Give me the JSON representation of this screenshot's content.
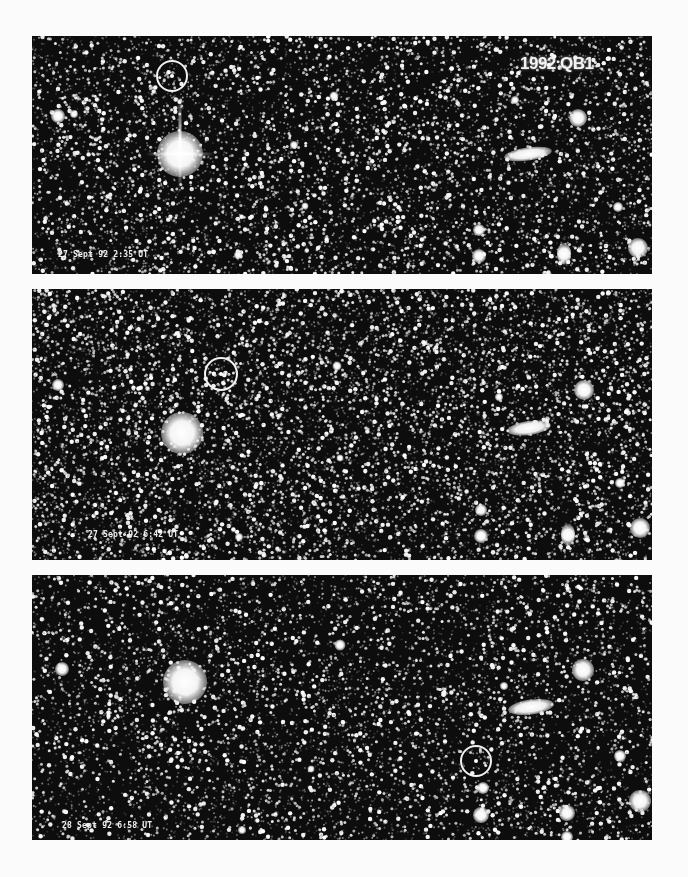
{
  "figure": {
    "object_name": "1992 QB1",
    "background_color": "#fbfbfb",
    "sky_color": "#0d0d0d",
    "panels": [
      {
        "id": "panel-1",
        "timestamp": "27 Sept 92 2:35 UT",
        "top": 36,
        "height": 238,
        "marker": {
          "x": 140,
          "y": 40,
          "d": 32
        },
        "bright_star": {
          "x": 148,
          "y": 118,
          "d": 46,
          "spikes": true
        },
        "galaxy": {
          "x": 496,
          "y": 118,
          "w": 48,
          "h": 13
        },
        "objects": [
          {
            "x": 26,
            "y": 80,
            "d": 14
          },
          {
            "x": 42,
            "y": 78,
            "d": 8
          },
          {
            "x": 302,
            "y": 60,
            "d": 9
          },
          {
            "x": 262,
            "y": 109,
            "d": 8
          },
          {
            "x": 273,
            "y": 170,
            "d": 7
          },
          {
            "x": 206,
            "y": 219,
            "d": 8
          },
          {
            "x": 546,
            "y": 82,
            "d": 18
          },
          {
            "x": 483,
            "y": 64,
            "d": 8
          },
          {
            "x": 447,
            "y": 194,
            "d": 12
          },
          {
            "x": 447,
            "y": 220,
            "d": 14
          },
          {
            "x": 532,
            "y": 218,
            "d": 14,
            "tall": true
          },
          {
            "x": 606,
            "y": 212,
            "d": 20
          },
          {
            "x": 586,
            "y": 171,
            "d": 10
          }
        ],
        "label_pos": {
          "x": 26,
          "y": 214
        }
      },
      {
        "id": "panel-2",
        "timestamp": "27 Sept 92 6:42 UT",
        "top": 289,
        "height": 271,
        "marker": {
          "x": 189,
          "y": 85,
          "d": 34
        },
        "bright_star": {
          "x": 150,
          "y": 144,
          "d": 42,
          "spikes": false
        },
        "galaxy": {
          "x": 497,
          "y": 139,
          "w": 44,
          "h": 14
        },
        "objects": [
          {
            "x": 26,
            "y": 96,
            "d": 12
          },
          {
            "x": 305,
            "y": 77,
            "d": 9
          },
          {
            "x": 308,
            "y": 169,
            "d": 7
          },
          {
            "x": 207,
            "y": 248,
            "d": 8
          },
          {
            "x": 552,
            "y": 101,
            "d": 20
          },
          {
            "x": 467,
            "y": 108,
            "d": 8
          },
          {
            "x": 449,
            "y": 221,
            "d": 12
          },
          {
            "x": 449,
            "y": 247,
            "d": 14
          },
          {
            "x": 536,
            "y": 246,
            "d": 14,
            "tall": true
          },
          {
            "x": 608,
            "y": 239,
            "d": 20
          },
          {
            "x": 588,
            "y": 194,
            "d": 10
          }
        ],
        "label_pos": {
          "x": 56,
          "y": 241
        }
      },
      {
        "id": "panel-3",
        "timestamp": "28 Sept 92 6:58 UT",
        "top": 575,
        "height": 265,
        "marker": {
          "x": 444,
          "y": 186,
          "d": 32
        },
        "bright_star": {
          "x": 153,
          "y": 107,
          "d": 44,
          "spikes": false
        },
        "galaxy": {
          "x": 499,
          "y": 132,
          "w": 46,
          "h": 15
        },
        "objects": [
          {
            "x": 30,
            "y": 94,
            "d": 14
          },
          {
            "x": 308,
            "y": 70,
            "d": 11
          },
          {
            "x": 279,
            "y": 194,
            "d": 7
          },
          {
            "x": 210,
            "y": 255,
            "d": 8
          },
          {
            "x": 551,
            "y": 95,
            "d": 22
          },
          {
            "x": 472,
            "y": 111,
            "d": 8
          },
          {
            "x": 451,
            "y": 213,
            "d": 12
          },
          {
            "x": 449,
            "y": 240,
            "d": 16
          },
          {
            "x": 535,
            "y": 238,
            "d": 16
          },
          {
            "x": 608,
            "y": 226,
            "d": 22
          },
          {
            "x": 588,
            "y": 181,
            "d": 12
          },
          {
            "x": 535,
            "y": 262,
            "d": 12
          }
        ],
        "label_pos": {
          "x": 30,
          "y": 246
        }
      }
    ],
    "object_label_pos": {
      "panel": 0,
      "x": 488,
      "y": 18
    }
  }
}
